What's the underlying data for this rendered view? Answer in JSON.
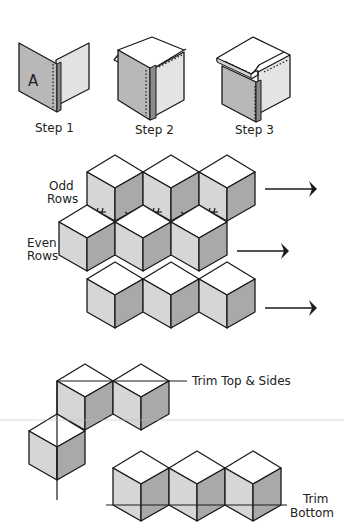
{
  "diagram": {
    "steps": [
      {
        "label": "Step 1",
        "panel_letter": "A"
      },
      {
        "label": "Step 2"
      },
      {
        "label": "Step 3"
      }
    ],
    "rows": {
      "odd_label_line1": "Odd",
      "odd_label_line2": "Rows",
      "even_label_line1": "Even",
      "even_label_line2": "Rows"
    },
    "trim_top_sides_label": "Trim Top & Sides",
    "trim_bottom_line1": "Trim",
    "trim_bottom_line2": "Bottom",
    "colors": {
      "cube_top": "#ffffff",
      "cube_left": "#d6d6d6",
      "cube_right": "#a9a9a9",
      "outline": "#1a1a1a"
    }
  }
}
